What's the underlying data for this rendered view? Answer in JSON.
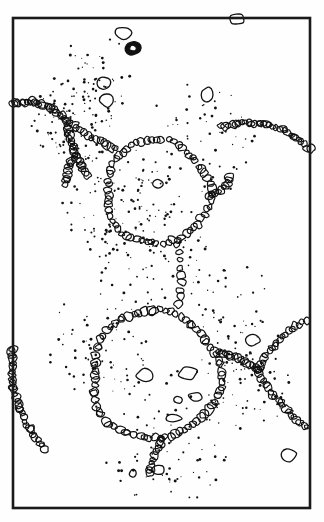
{
  "figure": {
    "title": "Bubble raft / foam cell line drawing",
    "medium": "line-art",
    "background_color": "#fefefe",
    "ink_color": "#111111",
    "frame": {
      "stroke_color": "#1a1a1a",
      "stroke_width": 2.6,
      "x": 13,
      "y": 18,
      "width": 297,
      "height": 490
    }
  },
  "chart_data": {
    "type": "scatter",
    "title": "Bubble raft / foam cell line drawing",
    "xlabel": "",
    "ylabel": "",
    "xlim": [
      13,
      310
    ],
    "ylim": [
      18,
      508
    ],
    "grid": false,
    "legend": "none",
    "cells": [
      {
        "name": "upper-cell",
        "cx": 157,
        "cy": 192,
        "r": 52,
        "bead_count": 62
      },
      {
        "name": "lower-cell",
        "cx": 155,
        "cy": 375,
        "r": 64,
        "bead_count": 76
      }
    ],
    "bridge": {
      "name": "film-bridge",
      "x": 178,
      "y_top": 245,
      "y_bottom": 312,
      "bead_count": 9
    },
    "junctions": [
      {
        "name": "left-plateau-border",
        "x": 66,
        "y": 120
      },
      {
        "name": "right-plateau-border",
        "x": 258,
        "y": 370
      }
    ],
    "edge_arcs": [
      {
        "name": "upper-left-arc",
        "from_x": 13,
        "from_y": 104,
        "to_x": 66,
        "to_y": 120
      },
      {
        "name": "lower-left-arc",
        "from_x": 13,
        "from_y": 348,
        "to_x": 48,
        "to_y": 452
      },
      {
        "name": "upper-right-arc",
        "from_x": 310,
        "from_y": 150,
        "to_x": 218,
        "to_y": 128
      },
      {
        "name": "right-upper-branch",
        "from_x": 258,
        "from_y": 370,
        "to_x": 310,
        "to_y": 318
      },
      {
        "name": "right-lower-branch",
        "from_x": 258,
        "from_y": 370,
        "to_x": 310,
        "to_y": 430
      }
    ],
    "stipple_point_count": 520,
    "free_bubbles": [
      {
        "name": "top-pebble-a",
        "cx": 123,
        "cy": 33,
        "rx": 8,
        "ry": 6.5
      },
      {
        "name": "dark-annulus",
        "cx": 133,
        "cy": 48,
        "rx": 7.5,
        "ry": 7,
        "filled": true
      },
      {
        "name": "top-border-pebble",
        "cx": 237,
        "cy": 19,
        "rx": 7,
        "ry": 5
      },
      {
        "name": "mid-left-pebble-a",
        "cx": 104,
        "cy": 83,
        "rx": 6.5,
        "ry": 6
      },
      {
        "name": "mid-left-pebble-b",
        "cx": 107,
        "cy": 100,
        "rx": 7,
        "ry": 6.5
      },
      {
        "name": "mid-right-pebble",
        "cx": 207,
        "cy": 95,
        "rx": 5.5,
        "ry": 8
      },
      {
        "name": "upper-cell-inclusion",
        "cx": 158,
        "cy": 184,
        "rx": 6,
        "ry": 4.5
      },
      {
        "name": "lower-cell-inclusion-a",
        "cx": 145,
        "cy": 375,
        "rx": 8,
        "ry": 6
      },
      {
        "name": "lower-cell-inclusion-b",
        "cx": 188,
        "cy": 373,
        "rx": 9,
        "ry": 6
      },
      {
        "name": "lower-cell-inclusion-c",
        "cx": 196,
        "cy": 397,
        "rx": 7,
        "ry": 4.5
      },
      {
        "name": "lower-cell-inclusion-d",
        "cx": 178,
        "cy": 400,
        "rx": 4,
        "ry": 3.5
      },
      {
        "name": "lower-cell-inclusion-e",
        "cx": 174,
        "cy": 418,
        "rx": 7,
        "ry": 4
      },
      {
        "name": "tail-pebble-a",
        "cx": 158,
        "cy": 470,
        "rx": 6,
        "ry": 5
      },
      {
        "name": "tail-pebble-b",
        "cx": 133,
        "cy": 473,
        "rx": 3.5,
        "ry": 4
      },
      {
        "name": "bottom-right-pebble",
        "cx": 288,
        "cy": 455,
        "rx": 8,
        "ry": 6.5
      },
      {
        "name": "right-free-pebble",
        "cx": 253,
        "cy": 340,
        "rx": 6.5,
        "ry": 5.5
      }
    ]
  }
}
